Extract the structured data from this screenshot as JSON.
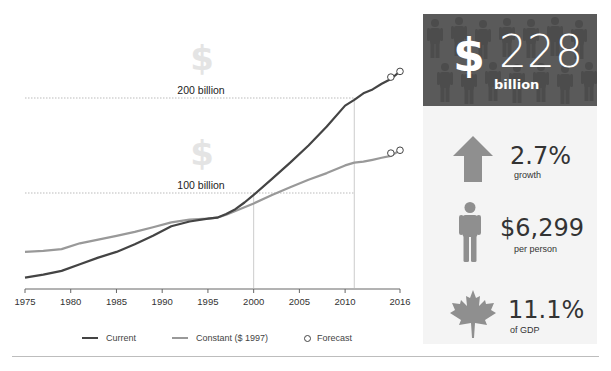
{
  "chart_data": {
    "type": "line",
    "title": "",
    "xlabel": "",
    "ylabel": "",
    "x_ticks": [
      "1975",
      "1980",
      "1985",
      "1990",
      "1995",
      "2000",
      "2005",
      "2010",
      "2016"
    ],
    "xlim": [
      1975,
      2016
    ],
    "ylim": [
      0,
      240
    ],
    "reference_lines": [
      {
        "label": "200 billion",
        "value": 200
      },
      {
        "label": "100 billion",
        "value": 100
      }
    ],
    "vertical_markers": [
      2000,
      2011
    ],
    "x": [
      1975,
      1977,
      1979,
      1981,
      1983,
      1985,
      1987,
      1989,
      1991,
      1993,
      1995,
      1996,
      1997,
      1998,
      1999,
      2000,
      2002,
      2004,
      2006,
      2008,
      2010,
      2011,
      2012,
      2013,
      2014,
      2015,
      2016
    ],
    "series": [
      {
        "name": "Current",
        "color": "#444444",
        "values": [
          11,
          14,
          18,
          25,
          32,
          38,
          46,
          55,
          65,
          70,
          73,
          74,
          78,
          83,
          90,
          98,
          115,
          132,
          150,
          170,
          192,
          198,
          205,
          209,
          215,
          220,
          228
        ]
      },
      {
        "name": "Constant ($ 1997)",
        "color": "#999999",
        "values": [
          38,
          39,
          41,
          47,
          51,
          55,
          59,
          64,
          69,
          72,
          73,
          74,
          77,
          81,
          85,
          89,
          98,
          106,
          114,
          121,
          129,
          132,
          133,
          135,
          137,
          139,
          145
        ]
      }
    ],
    "forecast_points": [
      {
        "series": "Current",
        "x": 2015,
        "y": 222
      },
      {
        "series": "Current",
        "x": 2016,
        "y": 228
      },
      {
        "series": "Constant ($ 1997)",
        "x": 2015,
        "y": 142
      },
      {
        "series": "Constant ($ 1997)",
        "x": 2016,
        "y": 145
      }
    ],
    "legend": [
      {
        "label": "Current",
        "style": "line",
        "color": "#444444"
      },
      {
        "label": "Constant ($ 1997)",
        "style": "line",
        "color": "#999999"
      },
      {
        "label": "Forecast",
        "style": "open-circle",
        "color": "#444444"
      }
    ],
    "legend_position": "bottom"
  },
  "chart": {
    "ref_200": "200 billion",
    "ref_100": "100 billion",
    "bg_symbol": "$",
    "ticks": [
      "1975",
      "1980",
      "1985",
      "1990",
      "1995",
      "2000",
      "2005",
      "2010",
      "2016"
    ],
    "legend": {
      "current": "Current",
      "constant": "Constant ($ 1997)",
      "forecast": "Forecast"
    }
  },
  "sidebar": {
    "hero": {
      "symbol": "$",
      "value": "228",
      "unit": "billion",
      "bg_color": "#5a5a5a"
    },
    "stats": [
      {
        "icon": "up-arrow-icon",
        "value": "2.7%",
        "label": "growth"
      },
      {
        "icon": "person-icon",
        "value": "$6,299",
        "label": "per person"
      },
      {
        "icon": "maple-leaf-icon",
        "value": "11.1%",
        "label": "of GDP"
      }
    ]
  }
}
